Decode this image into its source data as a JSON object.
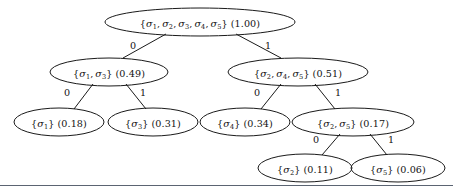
{
  "figure": {
    "kind": "huffman-tree-diagram",
    "symbol_prefix": "σ",
    "bottom_rule": {
      "y": 185,
      "color": "#5b6472"
    }
  },
  "nodes": [
    {
      "id": "root",
      "set_text": "{σ1, σ2, σ3, σ4, σ5}",
      "symbols": [
        "1",
        "2",
        "3",
        "4",
        "5"
      ],
      "probability": "(1.00)",
      "value": 1.0,
      "cx": 200,
      "cy": 22,
      "rx": 95,
      "ry": 14
    },
    {
      "id": "n-13",
      "set_text": "{σ1, σ3}",
      "symbols": [
        "1",
        "3"
      ],
      "probability": "(0.49)",
      "value": 0.49,
      "cx": 109,
      "cy": 72,
      "rx": 59,
      "ry": 14
    },
    {
      "id": "n-245",
      "set_text": "{σ2, σ4, σ5}",
      "symbols": [
        "2",
        "4",
        "5"
      ],
      "probability": "(0.51)",
      "value": 0.51,
      "cx": 298,
      "cy": 72,
      "rx": 70,
      "ry": 14
    },
    {
      "id": "n-1",
      "set_text": "{σ1}",
      "symbols": [
        "1"
      ],
      "probability": "(0.18)",
      "value": 0.18,
      "cx": 59,
      "cy": 122,
      "rx": 45,
      "ry": 14
    },
    {
      "id": "n-3",
      "set_text": "{σ3}",
      "symbols": [
        "3"
      ],
      "probability": "(0.31)",
      "value": 0.31,
      "cx": 153,
      "cy": 122,
      "rx": 45,
      "ry": 14
    },
    {
      "id": "n-4",
      "set_text": "{σ4}",
      "symbols": [
        "4"
      ],
      "probability": "(0.34)",
      "value": 0.34,
      "cx": 245,
      "cy": 122,
      "rx": 45,
      "ry": 14
    },
    {
      "id": "n-25",
      "set_text": "{σ2, σ5}",
      "symbols": [
        "2",
        "5"
      ],
      "probability": "(0.17)",
      "value": 0.17,
      "cx": 353,
      "cy": 122,
      "rx": 61,
      "ry": 14
    },
    {
      "id": "n-2",
      "set_text": "{σ2}",
      "symbols": [
        "2"
      ],
      "probability": "(0.11)",
      "value": 0.11,
      "cx": 305,
      "cy": 168,
      "rx": 47,
      "ry": 14
    },
    {
      "id": "n-5",
      "set_text": "{σ5}",
      "symbols": [
        "5"
      ],
      "probability": "(0.06)",
      "value": 0.06,
      "cx": 398,
      "cy": 168,
      "rx": 47,
      "ry": 14
    }
  ],
  "edges": [
    {
      "id": "e-root-13",
      "from": "root",
      "to": "n-13",
      "label": "0",
      "x1": 166,
      "y1": 34,
      "x2": 123,
      "y2": 58,
      "lx": 133,
      "ly": 45
    },
    {
      "id": "e-root-245",
      "from": "root",
      "to": "n-245",
      "label": "1",
      "x1": 236,
      "y1": 34,
      "x2": 281,
      "y2": 58,
      "lx": 268,
      "ly": 45
    },
    {
      "id": "e-13-1",
      "from": "n-13",
      "to": "n-1",
      "label": "0",
      "x1": 93,
      "y1": 84,
      "x2": 74,
      "y2": 109,
      "lx": 67,
      "ly": 92
    },
    {
      "id": "e-13-3",
      "from": "n-13",
      "to": "n-3",
      "label": "1",
      "x1": 126,
      "y1": 84,
      "x2": 146,
      "y2": 109,
      "lx": 143,
      "ly": 92
    },
    {
      "id": "e-245-4",
      "from": "n-245",
      "to": "n-4",
      "label": "0",
      "x1": 281,
      "y1": 84,
      "x2": 261,
      "y2": 109,
      "lx": 257,
      "ly": 92
    },
    {
      "id": "e-245-25",
      "from": "n-245",
      "to": "n-25",
      "label": "1",
      "x1": 315,
      "y1": 84,
      "x2": 335,
      "y2": 109,
      "lx": 338,
      "ly": 92
    },
    {
      "id": "e-25-2",
      "from": "n-25",
      "to": "n-2",
      "label": "0",
      "x1": 340,
      "y1": 134,
      "x2": 322,
      "y2": 155,
      "lx": 316,
      "ly": 139
    },
    {
      "id": "e-25-5",
      "from": "n-25",
      "to": "n-5",
      "label": "1",
      "x1": 370,
      "y1": 134,
      "x2": 387,
      "y2": 155,
      "lx": 391,
      "ly": 139
    }
  ]
}
